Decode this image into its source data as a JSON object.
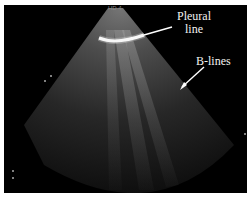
{
  "image": {
    "type": "lung-ultrasound",
    "annotations": [
      {
        "label_line1": "Pleural",
        "label_line2": "line"
      },
      {
        "label": "B-lines"
      }
    ],
    "header_text": "HD 4"
  },
  "colors": {
    "background": "#000000",
    "text": "#f2f2f2",
    "border": "#ffffff"
  }
}
